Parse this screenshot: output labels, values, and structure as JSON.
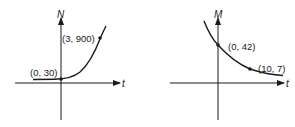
{
  "graphs": [
    {
      "name": "growth",
      "y_axis_label": "N",
      "x_axis_label": "t",
      "points": [
        {
          "label": "(0, 30)",
          "t": 0,
          "value": 30
        },
        {
          "label": "(3, 900)",
          "t": 3,
          "value": 900
        }
      ],
      "curve": "exponential-growth"
    },
    {
      "name": "decay",
      "y_axis_label": "M",
      "x_axis_label": "t",
      "points": [
        {
          "label": "(0, 42)",
          "t": 0,
          "value": 42
        },
        {
          "label": "(10, 7)",
          "t": 10,
          "value": 7
        }
      ],
      "curve": "exponential-decay"
    }
  ],
  "colors": {
    "ink": "#1a1a1a",
    "background": "#ffffff"
  }
}
